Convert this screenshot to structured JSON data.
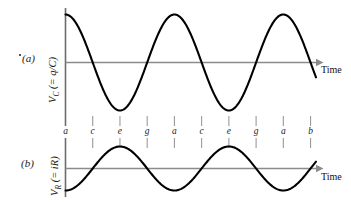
{
  "figure": {
    "title": "",
    "panels": [
      {
        "tag": "(a)",
        "ylabel_main": "V",
        "ylabel_sub": "C",
        "ylabel_rest": " (= q/C)",
        "xlabel": "Time"
      },
      {
        "tag": "(b)",
        "ylabel_main": "V",
        "ylabel_sub": "R",
        "ylabel_rest": " (= iR)",
        "xlabel": "Time"
      }
    ]
  },
  "point_labels": [
    "a",
    "c",
    "e",
    "g",
    "a",
    "c",
    "e",
    "g",
    "a",
    "b"
  ],
  "colors": {
    "curve": "#000000",
    "axis_gray": "#8b8b8b",
    "axis_dark": "#6b6b6b",
    "tick_gray": "#9a9a9a",
    "text": "#1a1a1a",
    "background": "#ffffff"
  },
  "chart_data": {
    "type": "line",
    "title": "",
    "panels": [
      {
        "name": "(a)",
        "ylabel": "V_C (= q/C)",
        "xlabel": "Time",
        "waveform": "cosine",
        "amplitude": 1.0,
        "phase_deg": 0,
        "cycles": 2.3,
        "xlim": [
          0,
          2.3
        ],
        "ylim": [
          -1.15,
          1.15
        ],
        "grid": false,
        "x": [
          0,
          0.125,
          0.25,
          0.375,
          0.5,
          0.625,
          0.75,
          0.875,
          1.0,
          1.125,
          1.25,
          1.375,
          1.5,
          1.625,
          1.75,
          1.875,
          2.0,
          2.125,
          2.25,
          2.3
        ],
        "y": [
          1.0,
          0.707,
          0.0,
          -0.707,
          -1.0,
          -0.707,
          0.0,
          0.707,
          1.0,
          0.707,
          0.0,
          -0.707,
          -1.0,
          -0.707,
          0.0,
          0.707,
          1.0,
          0.707,
          0.0,
          -0.309
        ]
      },
      {
        "name": "(b)",
        "ylabel": "V_R (= iR)",
        "xlabel": "Time",
        "waveform": "negative-sine",
        "amplitude": 1.0,
        "phase_deg": 180,
        "cycles": 2.3,
        "xlim": [
          0,
          2.3
        ],
        "ylim": [
          -1.15,
          1.15
        ],
        "grid": false,
        "x": [
          0,
          0.125,
          0.25,
          0.375,
          0.5,
          0.625,
          0.75,
          0.875,
          1.0,
          1.125,
          1.25,
          1.375,
          1.5,
          1.625,
          1.75,
          1.875,
          2.0,
          2.125,
          2.25,
          2.3
        ],
        "y": [
          0.0,
          -0.707,
          -1.0,
          -0.707,
          0.0,
          0.707,
          1.0,
          0.707,
          0.0,
          -0.707,
          -1.0,
          -0.707,
          0.0,
          0.707,
          1.0,
          0.707,
          0.0,
          -0.707,
          -1.0,
          -0.951
        ]
      }
    ],
    "tick_positions": [
      0,
      0.25,
      0.5,
      0.75,
      1.0,
      1.25,
      1.5,
      1.75,
      2.0,
      2.25
    ],
    "tick_labels": [
      "a",
      "c",
      "e",
      "g",
      "a",
      "c",
      "e",
      "g",
      "a",
      "b"
    ],
    "legend": null
  }
}
